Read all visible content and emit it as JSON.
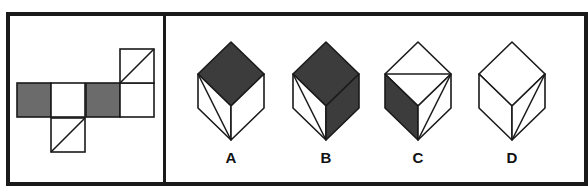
{
  "colors": {
    "stroke": "#1a1a1a",
    "net_shade": "#6b6b6b",
    "cube_shade": "#3c3c3c",
    "white": "#ffffff"
  },
  "net": {
    "square_size": 34,
    "cells": [
      {
        "id": "net-left-gray",
        "x": 17,
        "y": 83,
        "fill": "gray",
        "diagonal": "none"
      },
      {
        "id": "net-mid-white",
        "x": 51,
        "y": 83,
        "fill": "white",
        "diagonal": "none"
      },
      {
        "id": "net-center-gray",
        "x": 86,
        "y": 83,
        "fill": "gray",
        "diagonal": "none"
      },
      {
        "id": "net-right-white",
        "x": 120,
        "y": 83,
        "fill": "white",
        "diagonal": "none"
      },
      {
        "id": "net-top-diag",
        "x": 120,
        "y": 49,
        "fill": "white",
        "diagonal": "bl-tr"
      },
      {
        "id": "net-bottom-diag",
        "x": 51,
        "y": 118,
        "fill": "white",
        "diagonal": "bl-tr"
      }
    ]
  },
  "options": [
    {
      "label": "A",
      "cx": 231,
      "faces": {
        "top": "dark",
        "left": "white",
        "right": "white"
      },
      "lines": [
        "left-top-to-bottom"
      ]
    },
    {
      "label": "B",
      "cx": 326,
      "faces": {
        "top": "dark",
        "left": "white",
        "right": "dark"
      },
      "lines": [
        "left-top-to-bottom"
      ]
    },
    {
      "label": "C",
      "cx": 418,
      "faces": {
        "top": "white",
        "left": "dark",
        "right": "white"
      },
      "lines": [
        "top-horizontal",
        "right-top-to-bottom"
      ]
    },
    {
      "label": "D",
      "cx": 512,
      "faces": {
        "top": "white",
        "left": "white",
        "right": "white"
      },
      "lines": [
        "right-top-to-bottom"
      ]
    }
  ]
}
